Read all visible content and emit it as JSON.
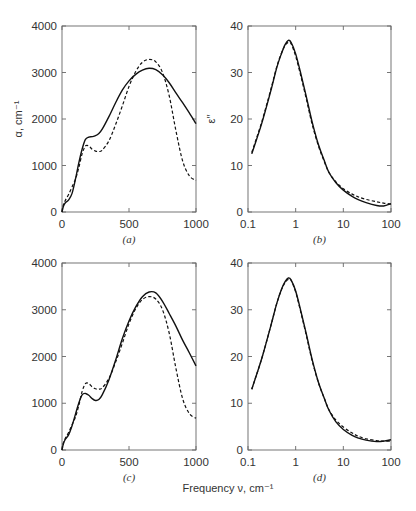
{
  "figure": {
    "shared_xlabel": "Frequency ν, cm⁻¹",
    "line_styles": {
      "series_1": "solid",
      "series_2": "dashed"
    },
    "colors": {
      "line": "#111111",
      "frame": "#666666",
      "text": "#333333",
      "background": "#ffffff"
    }
  },
  "chart_data": [
    {
      "id": "a",
      "panel_label": "(a)",
      "type": "line",
      "title": "",
      "xlabel": "",
      "ylabel": "α, cm⁻¹",
      "xscale": "linear",
      "xlim": [
        0,
        1000
      ],
      "ylim": [
        0,
        4000
      ],
      "xticks": [
        0,
        500,
        1000
      ],
      "xtick_labels": [
        "0",
        "500",
        "1000"
      ],
      "yticks": [
        0,
        1000,
        2000,
        3000,
        4000
      ],
      "ytick_labels": [
        "0",
        "1000",
        "2000",
        "3000",
        "4000"
      ],
      "grid": false,
      "series": [
        {
          "name": "solid",
          "style": "solid",
          "x": [
            0,
            10,
            25,
            50,
            75,
            100,
            125,
            150,
            175,
            200,
            225,
            250,
            275,
            300,
            350,
            400,
            450,
            500,
            550,
            600,
            650,
            700,
            750,
            800,
            850,
            900,
            950,
            1000
          ],
          "y": [
            0,
            120,
            200,
            260,
            400,
            700,
            1050,
            1350,
            1560,
            1610,
            1620,
            1640,
            1690,
            1780,
            2050,
            2350,
            2620,
            2820,
            2960,
            3050,
            3090,
            3060,
            2950,
            2780,
            2560,
            2350,
            2130,
            1900
          ]
        },
        {
          "name": "dashed",
          "style": "dashed",
          "x": [
            0,
            10,
            25,
            50,
            75,
            100,
            125,
            150,
            175,
            200,
            225,
            250,
            275,
            300,
            350,
            400,
            450,
            500,
            550,
            600,
            650,
            700,
            750,
            800,
            850,
            900,
            950,
            1000
          ],
          "y": [
            0,
            150,
            250,
            380,
            540,
            700,
            950,
            1250,
            1420,
            1420,
            1350,
            1310,
            1300,
            1330,
            1530,
            1880,
            2280,
            2700,
            3020,
            3220,
            3280,
            3230,
            3000,
            2500,
            1750,
            1100,
            780,
            680
          ]
        }
      ]
    },
    {
      "id": "b",
      "panel_label": "(b)",
      "type": "line",
      "title": "",
      "xlabel": "",
      "ylabel": "ε′′",
      "xscale": "log",
      "xlim": [
        0.1,
        100
      ],
      "ylim": [
        0,
        40
      ],
      "xticks": [
        0.1,
        1,
        10,
        100
      ],
      "xtick_labels": [
        "0.1",
        "1",
        "10",
        "100"
      ],
      "yticks": [
        0,
        10,
        20,
        30,
        40
      ],
      "ytick_labels": [
        "0",
        "10",
        "20",
        "30",
        "40"
      ],
      "grid": false,
      "series": [
        {
          "name": "solid",
          "style": "solid",
          "x": [
            0.12,
            0.15,
            0.2,
            0.3,
            0.4,
            0.5,
            0.6,
            0.7,
            0.8,
            1.0,
            1.3,
            1.7,
            2.2,
            3,
            4,
            5,
            7,
            10,
            15,
            20,
            30,
            50,
            70,
            100
          ],
          "y": [
            12.5,
            15.5,
            19.5,
            26,
            31,
            34,
            36,
            36.9,
            36.5,
            34,
            29.5,
            24.5,
            19.5,
            14.5,
            11,
            8.5,
            6.3,
            4.7,
            3.4,
            2.7,
            2.0,
            1.4,
            1.3,
            1.8
          ]
        },
        {
          "name": "dashed",
          "style": "dashed",
          "x": [
            0.12,
            0.15,
            0.2,
            0.3,
            0.4,
            0.5,
            0.6,
            0.7,
            0.8,
            1.0,
            1.3,
            1.7,
            2.2,
            3,
            4,
            5,
            7,
            10,
            15,
            20,
            30,
            50,
            70,
            100
          ],
          "y": [
            12.8,
            15.8,
            19.8,
            26.3,
            31.2,
            34.1,
            35.8,
            36.5,
            36.2,
            33.5,
            29,
            24,
            19,
            14.2,
            10.8,
            8.5,
            6.5,
            5.0,
            3.9,
            3.3,
            2.7,
            2.2,
            1.9,
            1.7
          ]
        }
      ]
    },
    {
      "id": "c",
      "panel_label": "(c)",
      "type": "line",
      "title": "",
      "xlabel": "",
      "ylabel": "",
      "xscale": "linear",
      "xlim": [
        0,
        1000
      ],
      "ylim": [
        0,
        4000
      ],
      "xticks": [
        0,
        500,
        1000
      ],
      "xtick_labels": [
        "0",
        "500",
        "1000"
      ],
      "yticks": [
        0,
        1000,
        2000,
        3000,
        4000
      ],
      "ytick_labels": [
        "0",
        "1000",
        "2000",
        "3000",
        "4000"
      ],
      "grid": false,
      "series": [
        {
          "name": "solid",
          "style": "solid",
          "x": [
            0,
            10,
            25,
            50,
            75,
            100,
            125,
            150,
            175,
            200,
            225,
            250,
            275,
            300,
            350,
            400,
            450,
            500,
            550,
            600,
            650,
            700,
            750,
            800,
            850,
            900,
            950,
            1000
          ],
          "y": [
            0,
            130,
            230,
            330,
            520,
            760,
            1000,
            1180,
            1210,
            1170,
            1100,
            1060,
            1080,
            1180,
            1500,
            1920,
            2380,
            2760,
            3060,
            3280,
            3380,
            3360,
            3180,
            2920,
            2650,
            2350,
            2080,
            1800
          ]
        },
        {
          "name": "dashed",
          "style": "dashed",
          "x": [
            0,
            10,
            25,
            50,
            75,
            100,
            125,
            150,
            175,
            200,
            225,
            250,
            275,
            300,
            350,
            400,
            450,
            500,
            550,
            600,
            650,
            700,
            750,
            800,
            850,
            900,
            950,
            1000
          ],
          "y": [
            0,
            150,
            250,
            380,
            540,
            700,
            950,
            1250,
            1420,
            1420,
            1350,
            1310,
            1300,
            1330,
            1530,
            1880,
            2280,
            2700,
            3020,
            3220,
            3280,
            3230,
            3000,
            2500,
            1750,
            1100,
            780,
            680
          ]
        }
      ]
    },
    {
      "id": "d",
      "panel_label": "(d)",
      "type": "line",
      "title": "",
      "xlabel": "",
      "ylabel": "",
      "xscale": "log",
      "xlim": [
        0.1,
        100
      ],
      "ylim": [
        0,
        40
      ],
      "xticks": [
        0.1,
        1,
        10,
        100
      ],
      "xtick_labels": [
        "0.1",
        "1",
        "10",
        "100"
      ],
      "yticks": [
        0,
        10,
        20,
        30,
        40
      ],
      "ytick_labels": [
        "0",
        "10",
        "20",
        "30",
        "40"
      ],
      "grid": false,
      "series": [
        {
          "name": "solid",
          "style": "solid",
          "x": [
            0.12,
            0.15,
            0.2,
            0.3,
            0.4,
            0.5,
            0.6,
            0.7,
            0.8,
            1.0,
            1.3,
            1.7,
            2.2,
            3,
            4,
            5,
            7,
            10,
            15,
            20,
            30,
            50,
            70,
            100
          ],
          "y": [
            13,
            16,
            20,
            26.5,
            31.3,
            34.3,
            36,
            36.8,
            36.4,
            34,
            29.5,
            24.5,
            19.5,
            14.5,
            11,
            8.5,
            6.0,
            4.4,
            3.2,
            2.6,
            2.1,
            1.8,
            1.9,
            2.2
          ]
        },
        {
          "name": "dashed",
          "style": "dashed",
          "x": [
            0.12,
            0.15,
            0.2,
            0.3,
            0.4,
            0.5,
            0.6,
            0.7,
            0.8,
            1.0,
            1.3,
            1.7,
            2.2,
            3,
            4,
            5,
            7,
            10,
            15,
            20,
            30,
            50,
            70,
            100
          ],
          "y": [
            13,
            16,
            20,
            26.5,
            31.3,
            34.2,
            35.8,
            36.5,
            36.3,
            33.8,
            29.2,
            24.2,
            19.2,
            14.4,
            11,
            8.6,
            6.4,
            4.9,
            3.7,
            3.0,
            2.4,
            2.0,
            1.9,
            1.9
          ]
        }
      ]
    }
  ]
}
